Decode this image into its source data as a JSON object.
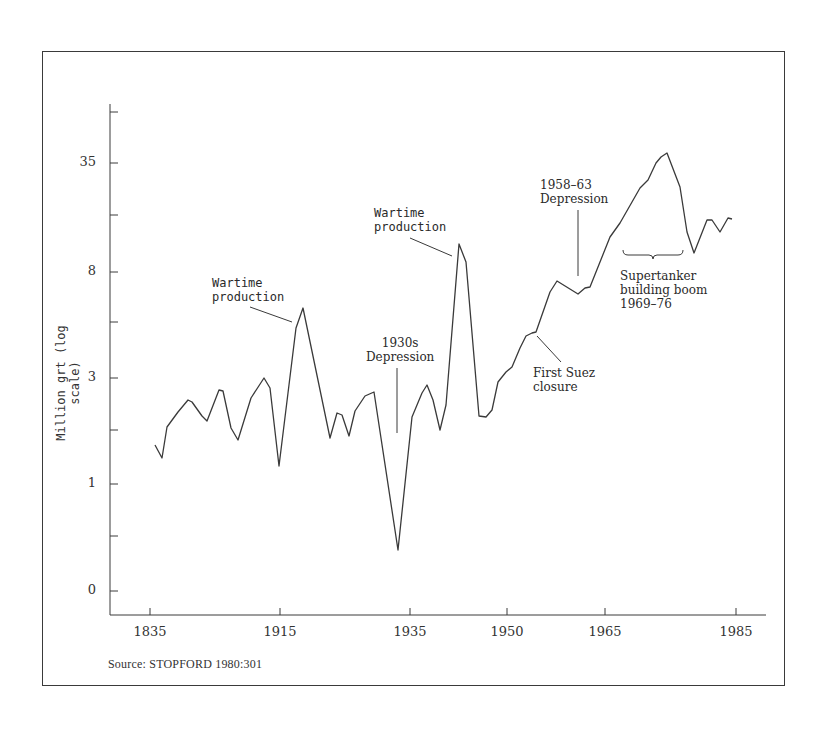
{
  "chart_data": {
    "type": "line",
    "title": "",
    "xlabel": "",
    "ylabel": "Million grt (log scale)",
    "y_scale": "log",
    "y_ticks": [
      {
        "label": "",
        "y": 112
      },
      {
        "label": "35",
        "y": 163
      },
      {
        "label": "",
        "y": 215
      },
      {
        "label": "8",
        "y": 272
      },
      {
        "label": "",
        "y": 322
      },
      {
        "label": "3",
        "y": 378
      },
      {
        "label": "",
        "y": 430
      },
      {
        "label": "1",
        "y": 484
      },
      {
        "label": "",
        "y": 536
      },
      {
        "label": "0",
        "y": 591
      }
    ],
    "x_ticks": [
      {
        "label": "1835",
        "x": 150
      },
      {
        "label": "1915",
        "x": 280
      },
      {
        "label": "1935",
        "x": 410
      },
      {
        "label": "1950",
        "x": 507
      },
      {
        "label": "1965",
        "x": 605
      },
      {
        "label": "1985",
        "x": 736
      }
    ],
    "grid": false,
    "legend": null,
    "series": [
      {
        "name": "World shipbuilding output (million grt)",
        "approx_values": [
          {
            "x": "c.1850s",
            "y": 1.9
          },
          {
            "x": "",
            "y": 1.6
          },
          {
            "x": "",
            "y": 2.2
          },
          {
            "x": "",
            "y": 2.5
          },
          {
            "x": "",
            "y": 2.7
          },
          {
            "x": "",
            "y": 2.6
          },
          {
            "x": "",
            "y": 2.3
          },
          {
            "x": "",
            "y": 2.2
          },
          {
            "x": "",
            "y": 2.8
          },
          {
            "x": "",
            "y": 2.7
          },
          {
            "x": "",
            "y": 2.0
          },
          {
            "x": "",
            "y": 1.9
          },
          {
            "x": "",
            "y": 2.5
          },
          {
            "x": "",
            "y": 2.9
          },
          {
            "x": "",
            "y": 2.7
          },
          {
            "x": "c.1915",
            "y": 1.5
          },
          {
            "x": "",
            "y": 4.5
          },
          {
            "x": "c.1919",
            "y": 5.3
          },
          {
            "x": "",
            "y": 1.8
          },
          {
            "x": "",
            "y": 2.2
          },
          {
            "x": "",
            "y": 2.2
          },
          {
            "x": "",
            "y": 1.8
          },
          {
            "x": "",
            "y": 2.3
          },
          {
            "x": "",
            "y": 2.6
          },
          {
            "x": "",
            "y": 2.7
          },
          {
            "x": "c.1933",
            "y": 0.35
          },
          {
            "x": "",
            "y": 2.3
          },
          {
            "x": "",
            "y": 2.7
          },
          {
            "x": "",
            "y": 2.9
          },
          {
            "x": "",
            "y": 2.6
          },
          {
            "x": "",
            "y": 1.9
          },
          {
            "x": "",
            "y": 2.3
          },
          {
            "x": "c.1944",
            "y": 10.5
          },
          {
            "x": "",
            "y": 8.7
          },
          {
            "x": "",
            "y": 2.0
          },
          {
            "x": "",
            "y": 2.0
          },
          {
            "x": "",
            "y": 2.1
          },
          {
            "x": "",
            "y": 2.8
          },
          {
            "x": "",
            "y": 3.1
          },
          {
            "x": "",
            "y": 3.3
          },
          {
            "x": "",
            "y": 4.0
          },
          {
            "x": "",
            "y": 4.4
          },
          {
            "x": "",
            "y": 4.5
          },
          {
            "x": "",
            "y": 6.0
          },
          {
            "x": "",
            "y": 6.6
          },
          {
            "x": "c.1961",
            "y": 6.1
          },
          {
            "x": "",
            "y": 6.3
          },
          {
            "x": "",
            "y": 6.4
          },
          {
            "x": "",
            "y": 10.0
          },
          {
            "x": "",
            "y": 11.5
          },
          {
            "x": "",
            "y": 17
          },
          {
            "x": "",
            "y": 19
          },
          {
            "x": "",
            "y": 23
          },
          {
            "x": "",
            "y": 28
          },
          {
            "x": "c.1975",
            "y": 31
          },
          {
            "x": "",
            "y": 19
          },
          {
            "x": "",
            "y": 11.5
          },
          {
            "x": "",
            "y": 9.3
          },
          {
            "x": "",
            "y": 13
          },
          {
            "x": "",
            "y": 13
          },
          {
            "x": "",
            "y": 11.5
          },
          {
            "x": "",
            "y": 13.5
          },
          {
            "x": "1985",
            "y": 13.3
          }
        ],
        "pixel_points": [
          [
            155,
            445
          ],
          [
            162,
            458
          ],
          [
            167,
            427
          ],
          [
            178,
            412
          ],
          [
            188,
            400
          ],
          [
            192,
            402
          ],
          [
            202,
            416
          ],
          [
            207,
            421
          ],
          [
            219,
            390
          ],
          [
            223,
            391
          ],
          [
            231,
            428
          ],
          [
            238,
            440
          ],
          [
            251,
            398
          ],
          [
            264,
            378
          ],
          [
            270,
            388
          ],
          [
            279,
            466
          ],
          [
            296,
            328
          ],
          [
            303,
            308
          ],
          [
            330,
            438
          ],
          [
            337,
            413
          ],
          [
            342,
            415
          ],
          [
            349,
            436
          ],
          [
            355,
            411
          ],
          [
            365,
            396
          ],
          [
            374,
            392
          ],
          [
            398,
            550
          ],
          [
            412,
            417
          ],
          [
            422,
            393
          ],
          [
            427,
            385
          ],
          [
            433,
            400
          ],
          [
            440,
            430
          ],
          [
            446,
            405
          ],
          [
            459,
            244
          ],
          [
            466,
            262
          ],
          [
            479,
            416
          ],
          [
            486,
            417
          ],
          [
            492,
            410
          ],
          [
            498,
            382
          ],
          [
            506,
            372
          ],
          [
            512,
            367
          ],
          [
            520,
            348
          ],
          [
            526,
            336
          ],
          [
            532,
            333
          ],
          [
            536,
            332
          ],
          [
            550,
            292
          ],
          [
            557,
            281
          ],
          [
            578,
            294
          ],
          [
            585,
            288
          ],
          [
            590,
            287
          ],
          [
            610,
            237
          ],
          [
            620,
            223
          ],
          [
            640,
            188
          ],
          [
            648,
            180
          ],
          [
            656,
            163
          ],
          [
            661,
            157
          ],
          [
            667,
            153
          ],
          [
            680,
            187
          ],
          [
            687,
            232
          ],
          [
            694,
            253
          ],
          [
            707,
            220
          ],
          [
            712,
            220
          ],
          [
            720,
            232
          ],
          [
            728,
            218
          ],
          [
            732,
            219
          ]
        ]
      }
    ],
    "annotations": [
      {
        "id": "wartime-ww1",
        "lines": [
          "Wartime",
          "production"
        ],
        "x": 212,
        "y": 276,
        "leader": [
          250,
          307,
          292,
          322
        ]
      },
      {
        "id": "depression-1930s",
        "lines": [
          "1930s",
          "Depression"
        ],
        "x": 366,
        "y": 336,
        "leader": [
          397,
          368,
          397,
          433
        ]
      },
      {
        "id": "wartime-ww2",
        "lines": [
          "Wartime",
          "production"
        ],
        "x": 374,
        "y": 206,
        "leader": [
          410,
          238,
          452,
          256
        ]
      },
      {
        "id": "first-suez",
        "lines": [
          "First Suez",
          "closure"
        ],
        "x": 533,
        "y": 366,
        "leader": [
          537,
          336,
          561,
          362
        ]
      },
      {
        "id": "depression-1958",
        "lines": [
          "1958–63",
          "Depression"
        ],
        "x": 540,
        "y": 178,
        "leader": [
          578,
          210,
          578,
          276
        ]
      },
      {
        "id": "supertanker",
        "lines": [
          "Supertanker",
          "building boom",
          "1969–76"
        ],
        "x": 620,
        "y": 269,
        "brace": [
          623,
          683,
          250
        ]
      }
    ],
    "source": "Source:  STOPFORD 1980:301"
  },
  "colors": {
    "line": "#3a3a3a",
    "frame": "#3a3a3a",
    "text": "#2a2a2a",
    "background": "#ffffff"
  }
}
